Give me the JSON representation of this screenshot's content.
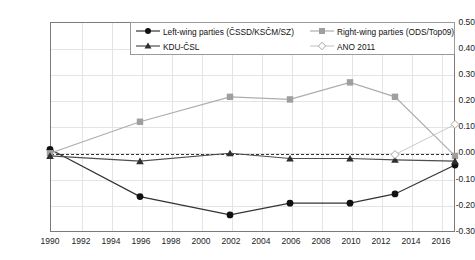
{
  "chart_data": {
    "type": "line",
    "title": "",
    "xlabel": "",
    "ylabel": "",
    "xlim": [
      1990,
      2017
    ],
    "ylim": [
      -0.3,
      0.5
    ],
    "grid": true,
    "legend_position": "top-center",
    "xticks": [
      "1990",
      "1992",
      "1994",
      "1996",
      "1998",
      "2000",
      "2002",
      "2004",
      "2006",
      "2008",
      "2010",
      "2012",
      "2014",
      "2016"
    ],
    "yticks": [
      "0.50",
      "0.40",
      "0.30",
      "0.20",
      "0.10",
      "0.00",
      "-0.10",
      "-0.20",
      "-0.30"
    ],
    "zero_reference_line": 0.0,
    "x": [
      1990,
      1996,
      2002,
      2006,
      2010,
      2013,
      2017
    ],
    "series": [
      {
        "name": "Left-wing parties (ČSSD/KSČM/SZ)",
        "color": "#333333",
        "marker": "circle",
        "x": [
          1990,
          1996,
          2002,
          2006,
          2010,
          2013,
          2017
        ],
        "values": [
          0.015,
          -0.165,
          -0.235,
          -0.19,
          -0.19,
          -0.155,
          -0.045
        ]
      },
      {
        "name": "Right-wing parties (ODS/Top09)",
        "color": "#adadad",
        "marker": "square",
        "x": [
          1990,
          1996,
          2002,
          2006,
          2010,
          2013,
          2017
        ],
        "values": [
          0.0,
          0.12,
          0.215,
          0.205,
          0.27,
          0.215,
          -0.01
        ]
      },
      {
        "name": "KDU-ČSL",
        "color": "#4d4d4d",
        "marker": "triangle",
        "x": [
          1990,
          1996,
          2002,
          2006,
          2010,
          2013,
          2017
        ],
        "values": [
          -0.01,
          -0.03,
          0.0,
          -0.02,
          -0.02,
          -0.025,
          -0.03
        ]
      },
      {
        "name": "ANO 2011",
        "color": "#c9c9c9",
        "marker": "diamond",
        "x": [
          2013,
          2017
        ],
        "values": [
          -0.005,
          0.11
        ]
      }
    ]
  },
  "legend": {
    "items": [
      {
        "label": "Left-wing parties (ČSSD/KSČM/SZ)",
        "marker": "circle",
        "color": "#333333"
      },
      {
        "label": "Right-wing parties (ODS/Top09)",
        "marker": "square",
        "color": "#adadad"
      },
      {
        "label": "KDU-ČSL",
        "marker": "triangle",
        "color": "#4d4d4d"
      },
      {
        "label": "ANO 2011",
        "marker": "diamond",
        "color": "#c9c9c9"
      }
    ]
  }
}
